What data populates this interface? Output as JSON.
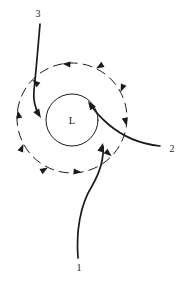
{
  "figure": {
    "type": "schematic-diagram",
    "background_color": "#ffffff",
    "line_color": "#1a1a1a",
    "width": 186,
    "height": 282
  },
  "center": {
    "label": "L",
    "meaning": "low-pressure-center",
    "x": 72,
    "y": 120,
    "inner_circle_radius": 26
  },
  "flow_ring": {
    "style": "dashed",
    "rotation": "counterclockwise",
    "radius": 55,
    "cx": 72,
    "cy": 118,
    "arrow_count": 10
  },
  "trajectories": [
    {
      "label": "1",
      "label_x": 79,
      "label_y": 271,
      "origin": "bottom",
      "description": "curve entering from lower right toward center",
      "path": "M 78 258 C 76 232, 80 205, 92 186 C 100 172, 104 158, 103 146",
      "arrow_tip_x": 103,
      "arrow_tip_y": 143,
      "arrow_angle": -75
    },
    {
      "label": "2",
      "label_x": 172,
      "label_y": 152,
      "origin": "right",
      "description": "curve entering from the right toward center",
      "path": "M 160 146 C 140 144, 122 136, 108 124 C 100 117, 94 110, 90 104",
      "arrow_tip_x": 88,
      "arrow_tip_y": 101,
      "arrow_angle": -124
    },
    {
      "label": "3",
      "label_x": 38,
      "label_y": 17,
      "origin": "top",
      "description": "curve entering from the top toward center",
      "path": "M 40 24 C 38 48, 36 72, 34 90 C 33 100, 35 108, 39 115",
      "arrow_tip_x": 41,
      "arrow_tip_y": 118,
      "arrow_angle": 58
    }
  ],
  "ring_arrows": [
    {
      "angle_deg": 100,
      "name": "ring-arrow-top"
    },
    {
      "angle_deg": 136,
      "name": "ring-arrow-upper-left"
    },
    {
      "angle_deg": 172,
      "name": "ring-arrow-left"
    },
    {
      "angle_deg": 208,
      "name": "ring-arrow-lower-left"
    },
    {
      "angle_deg": 244,
      "name": "ring-arrow-bottom-left"
    },
    {
      "angle_deg": 280,
      "name": "ring-arrow-bottom"
    },
    {
      "angle_deg": 316,
      "name": "ring-arrow-bottom-right"
    },
    {
      "angle_deg": 352,
      "name": "ring-arrow-right"
    },
    {
      "angle_deg": 28,
      "name": "ring-arrow-upper-right"
    },
    {
      "angle_deg": 64,
      "name": "ring-arrow-top-right"
    }
  ]
}
